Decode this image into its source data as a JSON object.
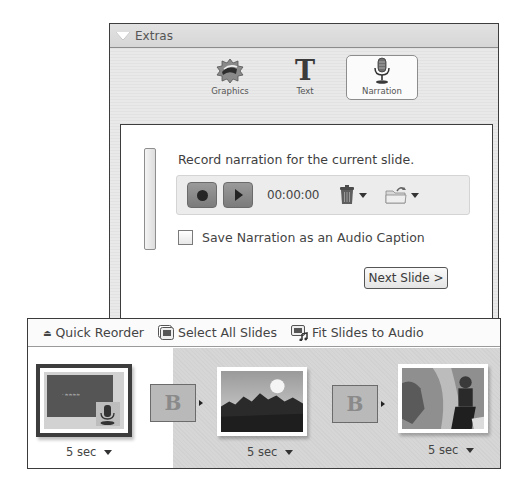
{
  "extras": {
    "title": "Extras",
    "tabs": [
      {
        "label": "Graphics",
        "icon": "graphics-icon",
        "selected": false
      },
      {
        "label": "Text",
        "icon": "text-icon",
        "glyph": "T",
        "selected": false
      },
      {
        "label": "Narration",
        "icon": "microphone-icon",
        "selected": true
      }
    ],
    "narration": {
      "instruction": "Record narration for the current slide.",
      "timer": "00:00:00",
      "checkbox_label": "Save Narration as an Audio Caption",
      "checkbox_checked": false,
      "next_button": "Next Slide >"
    }
  },
  "toolbar": {
    "quick_reorder": "Quick Reorder",
    "select_all": "Select All Slides",
    "fit_slides": "Fit Slides to Audio"
  },
  "filmstrip": {
    "slides": [
      {
        "duration": "5 sec",
        "selected": true,
        "has_narration": true
      },
      {
        "duration": "5 sec",
        "selected": false,
        "has_narration": false
      },
      {
        "duration": "5 sec",
        "selected": false,
        "has_narration": false
      }
    ],
    "transitions": [
      {
        "glyph": "B"
      },
      {
        "glyph": "B"
      }
    ]
  }
}
